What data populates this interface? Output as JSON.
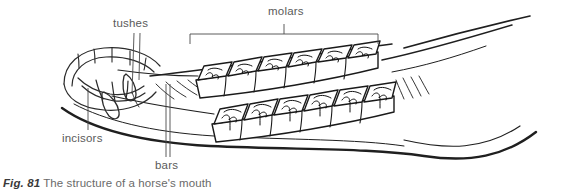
{
  "figure": {
    "caption_prefix": "Fig. 81",
    "caption_text": "The structure of a horse's mouth",
    "style": "pen-and-ink line drawing",
    "background_color": "#ffffff",
    "ink_color": "#1a1a1a",
    "label_color": "#5a5a5a",
    "caption_color": "#6a6a6a"
  },
  "labels": {
    "tushes": "tushes",
    "molars": "molars",
    "incisors": "incisors",
    "bars": "bars"
  },
  "annotations": {
    "molars_bracket": {
      "type": "span-bracket",
      "left_x": 190,
      "right_x": 378,
      "top_y": 34,
      "drop": 10,
      "tick_x": 284
    },
    "tushes_leaders": [
      {
        "x1": 134,
        "y1": 32,
        "x2": 132,
        "y2": 92
      },
      {
        "x1": 140,
        "y1": 32,
        "x2": 139,
        "y2": 78
      }
    ],
    "incisors_leader": {
      "x1": 88,
      "y1": 130,
      "x2": 88,
      "y2": 90
    },
    "bars_leaders": [
      {
        "x1": 166,
        "y1": 158,
        "x2": 166,
        "y2": 84
      },
      {
        "x1": 170,
        "y1": 158,
        "x2": 170,
        "y2": 84
      }
    ]
  },
  "anatomy": {
    "upper_molar_row": {
      "count": 6,
      "start_x": 196,
      "start_y": 78,
      "end_x": 380,
      "end_y": 50,
      "tooth_width": 31,
      "tooth_height": 22,
      "enamel_pattern": "wavy-infundibulum"
    },
    "lower_molar_row": {
      "count": 6,
      "start_x": 210,
      "start_y": 122,
      "end_x": 395,
      "end_y": 96,
      "tooth_width": 31,
      "tooth_height": 24,
      "enamel_pattern": "wavy-infundibulum"
    },
    "incisor_arch": {
      "count": 7,
      "center_x": 105,
      "center_y": 78,
      "note": "curved front arch of jaw"
    },
    "tush_teeth": {
      "count": 2,
      "shape": "pointed-canine"
    },
    "jaw_contours": {
      "upper_sweep_count": 3,
      "lower_sweep_count": 2,
      "direction": "front-left to back-right"
    }
  }
}
